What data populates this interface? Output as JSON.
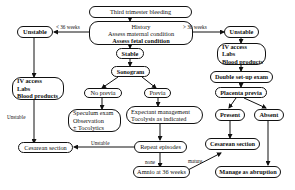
{
  "diagram": {
    "nodes": {
      "start": "Third trimester bleeding",
      "history": [
        "History",
        "Assess maternal condition",
        "Assess fetal condition"
      ],
      "unstable_left": "Unstable",
      "unstable_right": "Unstable",
      "iv_left": [
        "IV access",
        "Labs",
        "Blood products"
      ],
      "iv_right": [
        "IV access",
        "Labs",
        "Blood products"
      ],
      "stable": "Stable",
      "sonogram": "Sonogram",
      "no_previa": "No previa",
      "previa": "Previa",
      "speculum": [
        "Speculum exam",
        "Observation",
        "± Tocolytics"
      ],
      "expectant": [
        "Expectant management",
        "Tocolysis as indicated"
      ],
      "cesarean_left": "Cesarean section",
      "repeat": "Repeat episodes",
      "amnio": "Amnio at 36 weeks",
      "double_setup": "Double set-up exam",
      "placenta_previa": "Placenta previa",
      "present": "Present",
      "absent": "Absent",
      "cesarean_right": "Cesarean section",
      "abruption": "Manage as abruption"
    },
    "edge_labels": {
      "lt36": "< 36 weeks",
      "gt36": "> 36 weeks",
      "unstable_side": "Unstable",
      "unstable_repeat": "Unstable",
      "none": "none",
      "mature": "mature"
    }
  }
}
